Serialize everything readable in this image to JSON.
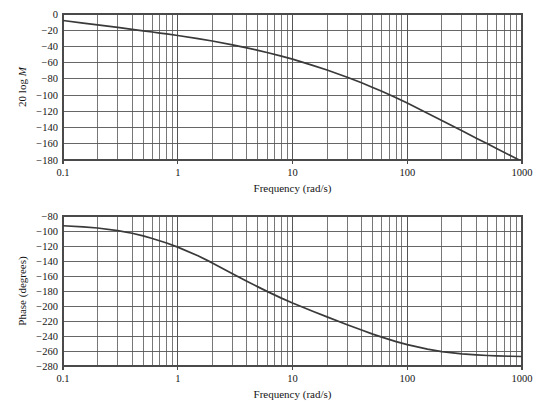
{
  "figure": {
    "background_color": "#ffffff",
    "line_color": "#3a3a3a",
    "grid_color": "#555555",
    "frame_color": "#4a4a4a"
  },
  "magnitude_panel": {
    "y_axis_label_prefix": "20 log ",
    "y_axis_label_italic": "M",
    "x_axis_label": "Frequency (rad/s)",
    "y_ticks": [
      "0",
      "−20",
      "−40",
      "−60",
      "−80",
      "−100",
      "−120",
      "−140",
      "−160",
      "−180"
    ],
    "x_ticks": [
      "0.1",
      "1",
      "10",
      "100",
      "1000"
    ]
  },
  "phase_panel": {
    "y_axis_label": "Phase (degrees)",
    "x_axis_label": "Frequency (rad/s)",
    "y_ticks": [
      "−80",
      "−100",
      "−120",
      "−140",
      "−160",
      "−180",
      "−200",
      "−220",
      "−240",
      "−260",
      "−280"
    ],
    "x_ticks": [
      "0.1",
      "1",
      "10",
      "100",
      "1000"
    ]
  },
  "chart_data": [
    {
      "type": "line",
      "title": "",
      "xlabel": "Frequency (rad/s)",
      "ylabel": "20 log M",
      "xscale": "log",
      "xlim": [
        0.1,
        1000
      ],
      "ylim": [
        -180,
        0
      ],
      "grid": true,
      "legend": "none",
      "xticks": [
        0.1,
        1,
        10,
        100,
        1000
      ],
      "xticklabels": [
        "0.1",
        "1",
        "10",
        "100",
        "1000"
      ],
      "yticks": [
        0,
        -20,
        -40,
        -60,
        -80,
        -100,
        -120,
        -140,
        -160,
        -180
      ],
      "yticklabels": [
        "0",
        "-20",
        "-40",
        "-60",
        "-80",
        "-100",
        "-120",
        "-140",
        "-160",
        "-180"
      ],
      "series": [
        {
          "name": "magnitude",
          "x": [
            0.1,
            0.15,
            0.2,
            0.3,
            0.4,
            0.5,
            0.6,
            0.7,
            0.8,
            1.0,
            1.5,
            2.0,
            3.0,
            4.0,
            5.0,
            6.0,
            8.0,
            10.0,
            15.0,
            20.0,
            30.0,
            40.0,
            50.0,
            60.0,
            80.0,
            100.0,
            150.0,
            200.0,
            300.0,
            400.0,
            500.0,
            600.0,
            800.0,
            1000.0
          ],
          "y": [
            -8.0,
            -11.2,
            -13.4,
            -16.6,
            -18.9,
            -20.7,
            -22.2,
            -23.5,
            -24.6,
            -26.5,
            -30.3,
            -33.3,
            -38.0,
            -41.7,
            -44.8,
            -47.5,
            -52.0,
            -55.7,
            -63.3,
            -69.1,
            -78.0,
            -84.8,
            -90.5,
            -95.3,
            -103.3,
            -109.8,
            -122.3,
            -131.2,
            -144.0,
            -153.1,
            -160.1,
            -165.8,
            -174.8,
            -181.8
          ]
        }
      ]
    },
    {
      "type": "line",
      "title": "",
      "xlabel": "Frequency (rad/s)",
      "ylabel": "Phase (degrees)",
      "xscale": "log",
      "xlim": [
        0.1,
        1000
      ],
      "ylim": [
        -280,
        -80
      ],
      "grid": true,
      "legend": "none",
      "xticks": [
        0.1,
        1,
        10,
        100,
        1000
      ],
      "xticklabels": [
        "0.1",
        "1",
        "10",
        "100",
        "1000"
      ],
      "yticks": [
        -80,
        -100,
        -120,
        -140,
        -160,
        -180,
        -200,
        -220,
        -240,
        -260,
        -280
      ],
      "yticklabels": [
        "-80",
        "-100",
        "-120",
        "-140",
        "-160",
        "-180",
        "-200",
        "-220",
        "-240",
        "-260",
        "-280"
      ],
      "series": [
        {
          "name": "phase",
          "x": [
            0.1,
            0.15,
            0.2,
            0.3,
            0.4,
            0.5,
            0.6,
            0.8,
            1.0,
            1.5,
            2.0,
            3.0,
            4.0,
            5.0,
            6.0,
            8.0,
            10.0,
            15.0,
            20.0,
            30.0,
            40.0,
            50.0,
            60.0,
            80.0,
            100.0,
            150.0,
            200.0,
            300.0,
            400.0,
            500.0,
            600.0,
            800.0,
            1000.0
          ],
          "y": [
            -93.0,
            -94.5,
            -96.0,
            -99.5,
            -103.0,
            -106.5,
            -110.0,
            -116.0,
            -121.5,
            -133.0,
            -142.5,
            -157.0,
            -167.0,
            -174.5,
            -180.5,
            -189.5,
            -196.0,
            -207.0,
            -214.5,
            -225.0,
            -232.0,
            -237.5,
            -241.5,
            -247.5,
            -251.5,
            -257.5,
            -260.8,
            -263.8,
            -265.2,
            -266.0,
            -266.5,
            -267.0,
            -267.3
          ]
        }
      ]
    }
  ]
}
